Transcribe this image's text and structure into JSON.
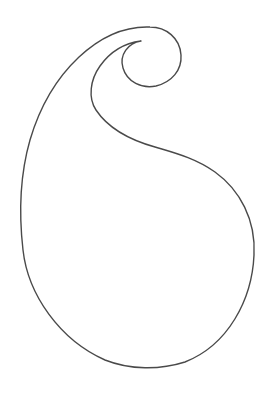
{
  "figure": {
    "subject": "paisley outline",
    "stroke_color": "#4a4a4a",
    "background_color": "#ffffff",
    "stroke_width": 1.4
  }
}
